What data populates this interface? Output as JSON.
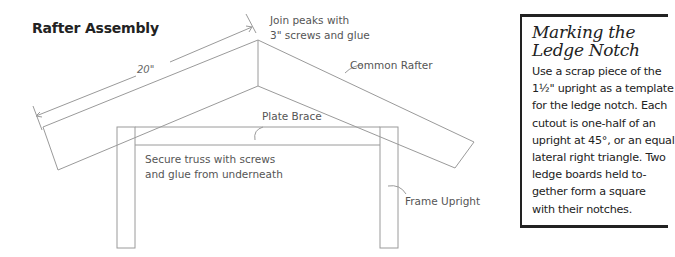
{
  "diagram": {
    "title": "Rafter Assembly",
    "dimension": "20\"",
    "labels": {
      "join_peaks_line1": "Join peaks with",
      "join_peaks_line2": "3\" screws and glue",
      "common_rafter": "Common Rafter",
      "plate_brace": "Plate Brace",
      "secure_truss_line1": "Secure truss with screws",
      "secure_truss_line2": "and glue from underneath",
      "frame_upright": "Frame Upright"
    },
    "line_color": "#9a9a9a"
  },
  "sidebar": {
    "title_line1": "Marking the",
    "title_line2": "Ledge Notch",
    "body": "Use a scrap piece of the\n1½\" upright as a template\nfor the ledge notch. Each\ncutout is one-half of an\nupright at 45°, or an equal\nlateral right triangle. Two\nledge boards held to-\ngether form a square\nwith their notches."
  }
}
